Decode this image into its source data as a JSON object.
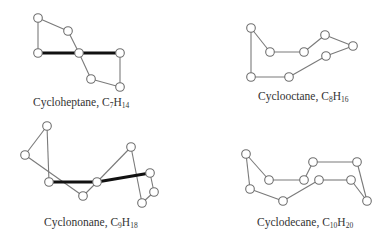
{
  "figure": {
    "molecules": [
      {
        "id": "cycloheptane",
        "name": "Cycloheptane",
        "formula_prefix": "C",
        "carbon_count": "7",
        "formula_mid": "H",
        "hydrogen_count": "14",
        "caption_pos": [
          33,
          97
        ],
        "atoms": [
          [
            38,
            18
          ],
          [
            68,
            31
          ],
          [
            38,
            53
          ],
          [
            79,
            53
          ],
          [
            120,
            53
          ],
          [
            91,
            79
          ],
          [
            120,
            87
          ]
        ],
        "bonds": [
          [
            0,
            1
          ],
          [
            0,
            2
          ],
          [
            1,
            3
          ],
          [
            3,
            5
          ],
          [
            5,
            6
          ],
          [
            4,
            6
          ]
        ],
        "front_bonds": [
          [
            2,
            3
          ],
          [
            3,
            4
          ]
        ]
      },
      {
        "id": "cyclooctane",
        "name": "Cyclooctane",
        "formula_prefix": "C",
        "carbon_count": "8",
        "formula_mid": "H",
        "hydrogen_count": "16",
        "caption_pos": [
          258,
          91
        ],
        "atoms": [
          [
            251,
            28
          ],
          [
            270,
            52
          ],
          [
            304,
            52
          ],
          [
            325,
            35
          ],
          [
            353,
            46
          ],
          [
            326,
            56
          ],
          [
            289,
            77
          ],
          [
            251,
            77
          ]
        ],
        "bonds": [
          [
            0,
            1
          ],
          [
            1,
            2
          ],
          [
            2,
            3
          ],
          [
            3,
            4
          ],
          [
            4,
            5
          ],
          [
            5,
            6
          ],
          [
            6,
            7
          ],
          [
            7,
            0
          ]
        ],
        "front_bonds": []
      },
      {
        "id": "cyclononane",
        "name": "Cyclononane",
        "formula_prefix": "C",
        "carbon_count": "9",
        "formula_mid": "H",
        "hydrogen_count": "18",
        "caption_pos": [
          44,
          217
        ],
        "atoms": [
          [
            47,
            126
          ],
          [
            25,
            155
          ],
          [
            49,
            182
          ],
          [
            97,
            182
          ],
          [
            83,
            196
          ],
          [
            131,
            147
          ],
          [
            150,
            173
          ],
          [
            154,
            192
          ],
          [
            142,
            203
          ]
        ],
        "bonds": [
          [
            0,
            1
          ],
          [
            0,
            2
          ],
          [
            1,
            4
          ],
          [
            4,
            3
          ],
          [
            3,
            5
          ],
          [
            5,
            8
          ],
          [
            6,
            7
          ],
          [
            7,
            8
          ]
        ],
        "front_bonds": [
          [
            2,
            3
          ],
          [
            3,
            6
          ]
        ]
      },
      {
        "id": "cyclodecane",
        "name": "Cyclodecane",
        "formula_prefix": "C",
        "carbon_count": "10",
        "formula_mid": "H",
        "hydrogen_count": "20",
        "caption_pos": [
          257,
          217
        ],
        "atoms": [
          [
            246,
            154
          ],
          [
            269,
            180
          ],
          [
            304,
            180
          ],
          [
            313,
            162
          ],
          [
            357,
            162
          ],
          [
            367,
            201
          ],
          [
            351,
            180
          ],
          [
            319,
            180
          ],
          [
            283,
            201
          ],
          [
            250,
            189
          ]
        ],
        "bonds": [
          [
            0,
            1
          ],
          [
            1,
            2
          ],
          [
            2,
            3
          ],
          [
            3,
            4
          ],
          [
            4,
            5
          ],
          [
            5,
            6
          ],
          [
            6,
            7
          ],
          [
            7,
            8
          ],
          [
            8,
            9
          ],
          [
            9,
            0
          ]
        ],
        "front_bonds": []
      }
    ]
  }
}
